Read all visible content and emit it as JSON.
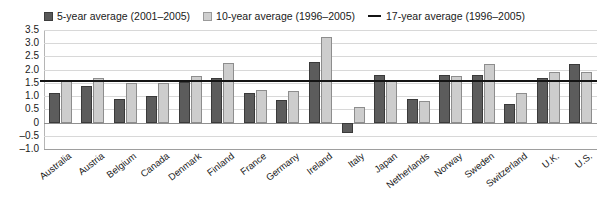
{
  "legend": {
    "items": [
      {
        "marker": "dark-square-swatch",
        "label": "5-year average (2001–2005)"
      },
      {
        "marker": "light-square-swatch",
        "label": "10-year average (1996–2005)"
      },
      {
        "marker": "black-line-swatch",
        "label": "17-year average (1996–2005)"
      }
    ]
  },
  "axis": {
    "yticks": [
      "3.5",
      "3.0",
      "2.5",
      "2.0",
      "1.5",
      "1.0",
      "0.5",
      "0",
      "–0.5",
      "–1.0"
    ],
    "ymin": -1.0,
    "ymax": 3.5
  },
  "colors": {
    "series_5yr": "#5c5c5c",
    "series_10yr": "#cdcdcd",
    "average_line": "#141414",
    "gridline": "#d8d8d8",
    "background": "#ffffff"
  },
  "chart_data": {
    "type": "bar",
    "title": "",
    "xlabel": "",
    "ylabel": "",
    "ylim": [
      -1.0,
      3.5
    ],
    "ytick_values": [
      3.5,
      3.0,
      2.5,
      2.0,
      1.5,
      1.0,
      0.5,
      0,
      -0.5,
      -1.0
    ],
    "grid": true,
    "legend_position": "top",
    "categories": [
      "Australia",
      "Austria",
      "Belgium",
      "Canada",
      "Denmark",
      "Finland",
      "France",
      "Germany",
      "Ireland",
      "Italy",
      "Japan",
      "Netherlands",
      "Norway",
      "Sweden",
      "Switzerland",
      "U.K.",
      "U.S."
    ],
    "series": [
      {
        "name": "5-year average (2001–2005)",
        "color": "#5c5c5c",
        "values": [
          1.1,
          1.4,
          0.9,
          1.0,
          1.55,
          1.7,
          1.1,
          0.85,
          2.3,
          -0.4,
          1.8,
          0.9,
          1.8,
          1.8,
          0.7,
          1.7,
          2.2
        ]
      },
      {
        "name": "10-year average (1996–2005)",
        "color": "#cdcdcd",
        "values": [
          1.6,
          1.7,
          1.5,
          1.5,
          1.75,
          2.25,
          1.25,
          1.2,
          3.25,
          0.6,
          1.6,
          0.8,
          1.75,
          2.2,
          1.1,
          1.9,
          1.9
        ]
      }
    ],
    "reference_lines": [
      {
        "name": "17-year average (1996–2005)",
        "value": 1.6,
        "color": "#141414"
      }
    ]
  }
}
